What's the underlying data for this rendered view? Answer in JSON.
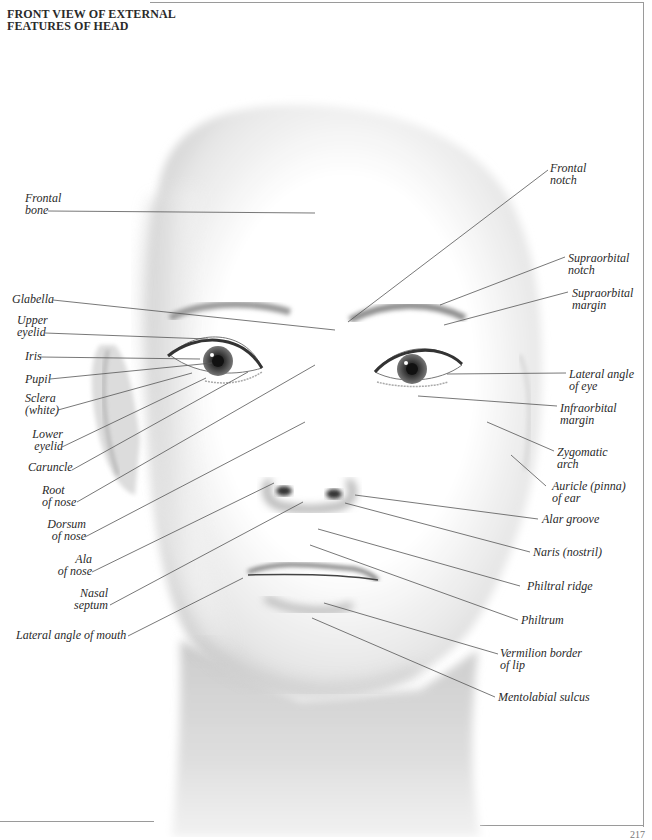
{
  "title": {
    "line1": "FRONT VIEW OF EXTERNAL",
    "line2": "FEATURES OF HEAD"
  },
  "page_number": "217",
  "labels_left": [
    {
      "id": "frontal-bone",
      "lines": [
        "Frontal",
        "bone"
      ]
    },
    {
      "id": "glabella",
      "lines": [
        "Glabella"
      ]
    },
    {
      "id": "upper-eyelid",
      "lines": [
        "Upper",
        "eyelid"
      ]
    },
    {
      "id": "iris",
      "lines": [
        "Iris"
      ]
    },
    {
      "id": "pupil",
      "lines": [
        "Pupil"
      ]
    },
    {
      "id": "sclera",
      "lines": [
        "Sclera",
        "(white)"
      ]
    },
    {
      "id": "lower-eyelid",
      "lines": [
        "Lower",
        "eyelid"
      ]
    },
    {
      "id": "caruncle",
      "lines": [
        "Caruncle"
      ]
    },
    {
      "id": "root-of-nose",
      "lines": [
        "Root",
        "of nose"
      ]
    },
    {
      "id": "dorsum-of-nose",
      "lines": [
        "Dorsum",
        "of nose"
      ]
    },
    {
      "id": "ala-of-nose",
      "lines": [
        "Ala",
        "of nose"
      ]
    },
    {
      "id": "nasal-septum",
      "lines": [
        "Nasal",
        "septum"
      ]
    },
    {
      "id": "lateral-angle-of-mouth",
      "lines": [
        "Lateral angle of mouth"
      ]
    }
  ],
  "labels_right": [
    {
      "id": "frontal-notch",
      "lines": [
        "Frontal",
        "notch"
      ]
    },
    {
      "id": "supraorbital-notch",
      "lines": [
        "Supraorbital",
        "notch"
      ]
    },
    {
      "id": "supraorbital-margin",
      "lines": [
        "Supraorbital",
        "margin"
      ]
    },
    {
      "id": "lateral-angle-of-eye",
      "lines": [
        "Lateral angle",
        "of eye"
      ]
    },
    {
      "id": "infraorbital-margin",
      "lines": [
        "Infraorbital",
        "margin"
      ]
    },
    {
      "id": "zygomatic-arch",
      "lines": [
        "Zygomatic",
        "arch"
      ]
    },
    {
      "id": "auricle-of-ear",
      "lines": [
        "Auricle (pinna)",
        "of ear"
      ]
    },
    {
      "id": "alar-groove",
      "lines": [
        "Alar groove"
      ]
    },
    {
      "id": "naris",
      "lines": [
        "Naris (nostril)"
      ]
    },
    {
      "id": "philtral-ridge",
      "lines": [
        "Philtral ridge"
      ]
    },
    {
      "id": "philtrum",
      "lines": [
        "Philtrum"
      ]
    },
    {
      "id": "vermilion-border",
      "lines": [
        "Vermilion border",
        "of lip"
      ]
    },
    {
      "id": "mentolabial-sulcus",
      "lines": [
        "Mentolabial sulcus"
      ]
    }
  ],
  "colors": {
    "line": "#555555",
    "text": "#2a2a2a",
    "frame": "#9a9a9a"
  }
}
